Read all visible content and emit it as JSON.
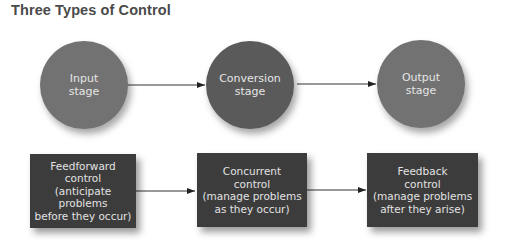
{
  "title": "Three Types of Control",
  "stages": [
    {
      "label": "Input\nstage"
    },
    {
      "label": "Conversion\nstage"
    },
    {
      "label": "Output\nstage"
    }
  ],
  "controls": [
    {
      "label": "Feedforward\ncontrol\n(anticipate problems\nbefore they occur)"
    },
    {
      "label": "Concurrent\ncontrol\n(manage problems\nas they occur)"
    },
    {
      "label": "Feedback\ncontrol\n(manage problems\nafter they arise)"
    }
  ],
  "colors": {
    "circle_light": "#727272",
    "circle_dark": "#5a5a5a",
    "box": "#3c3c3c",
    "title": "#4a4a4a"
  }
}
